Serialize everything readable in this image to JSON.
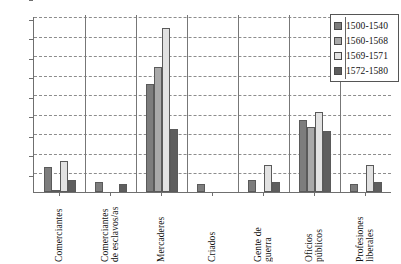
{
  "chart_data": {
    "type": "bar",
    "title": "",
    "xlabel": "",
    "ylabel": "",
    "ylim": [
      0,
      90
    ],
    "ytick_step": 10,
    "yticks": [
      0,
      10,
      20,
      30,
      40,
      50,
      60,
      70,
      80,
      90
    ],
    "grid": true,
    "legend_position": "top-right",
    "categories": [
      "Comerciantes",
      "Comerciantes\nde esclavos/as",
      "Mercaderes",
      "Criados",
      "Gente de\nguerra",
      "Oficios\npúblicos",
      "Profesiones\nliberales"
    ],
    "series": [
      {
        "name": "1500-1540",
        "color": "#7d7d7d",
        "values": [
          13,
          5,
          55,
          4,
          6,
          37,
          4
        ]
      },
      {
        "name": "1560-1568",
        "color": "#a9a9a9",
        "values": [
          1,
          0,
          64,
          0,
          0,
          33,
          0
        ]
      },
      {
        "name": "1569-1571",
        "color": "#e2e2e2",
        "values": [
          16,
          0,
          84,
          0,
          14,
          41,
          14
        ]
      },
      {
        "name": "1572-1580",
        "color": "#5e5e5e",
        "values": [
          6,
          4,
          32,
          0,
          5,
          31,
          5
        ]
      }
    ]
  },
  "legend": {
    "items": [
      {
        "label": "1500-1540"
      },
      {
        "label": "1560-1568"
      },
      {
        "label": "1569-1571"
      },
      {
        "label": "1572-1580"
      }
    ]
  },
  "axis": {
    "y_tick_labels": [
      "90",
      "80",
      "70",
      "60",
      "50",
      "40",
      "30",
      "20",
      "10",
      "0"
    ]
  }
}
